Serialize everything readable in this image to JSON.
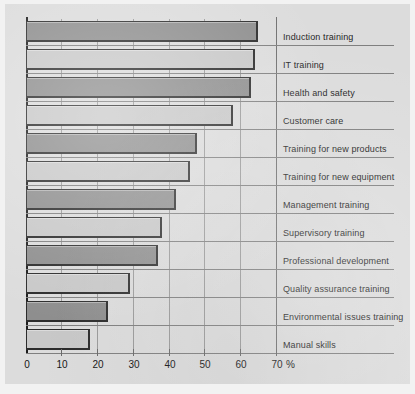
{
  "chart_data": {
    "type": "bar",
    "orientation": "horizontal",
    "title": "",
    "subtitle": "",
    "xlabel": "%",
    "ylabel": "",
    "xlim": [
      0,
      70
    ],
    "xticks": [
      0,
      10,
      20,
      30,
      40,
      50,
      60,
      70
    ],
    "xtick_labels": [
      "0",
      "10",
      "20",
      "30",
      "40",
      "50",
      "60",
      "70"
    ],
    "unit_label": "%",
    "grid": "vertical",
    "legend": "none",
    "categories": [
      "Induction training",
      "IT training",
      "Health and safety",
      "Customer care",
      "Training for new products",
      "Training for new equipment",
      "Management training",
      "Supervisory training",
      "Professional development",
      "Quality assurance training",
      "Environmental issues training",
      "Manual skills"
    ],
    "values": [
      65,
      64,
      63,
      58,
      48,
      46,
      42,
      38,
      37,
      29,
      23,
      18
    ],
    "bar_shades": [
      "dark",
      "light",
      "dark",
      "light",
      "dark",
      "light",
      "dark",
      "light",
      "dark",
      "light",
      "dark",
      "light"
    ],
    "colors": {
      "bar_dark": "#8e8e8e",
      "bar_light": "#c8c8c8",
      "bar_outline": "#2b2b2b",
      "panel_background": "#dcdcdc",
      "page_background": "#f2f2f2",
      "gridline": "#8e8e8e",
      "axis": "#1c1c1c",
      "text": "#1f1f1f"
    }
  }
}
